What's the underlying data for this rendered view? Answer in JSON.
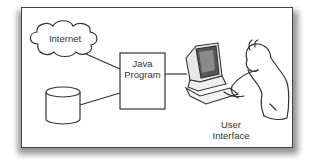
{
  "diagram": {
    "nodes": {
      "internet": {
        "label": "Internet",
        "shape": "cloud"
      },
      "java_program": {
        "label_line1": "Java",
        "label_line2": "Program",
        "shape": "rectangle"
      },
      "database": {
        "label": "",
        "shape": "cylinder"
      },
      "user_interface": {
        "label_line1": "User",
        "label_line2": "Interface",
        "shape": "illustration-person-at-computer"
      }
    },
    "edges": [
      {
        "from": "internet",
        "to": "java_program"
      },
      {
        "from": "database",
        "to": "java_program"
      },
      {
        "from": "java_program",
        "to": "user_interface"
      }
    ],
    "colors": {
      "stroke": "#333333",
      "background": "#ffffff",
      "shadow": "#6a6a6a"
    }
  }
}
